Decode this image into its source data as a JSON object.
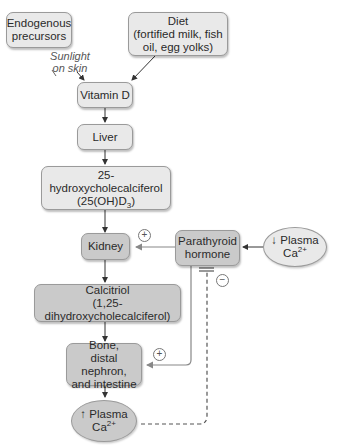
{
  "diagram": {
    "nodes": {
      "endogenous": {
        "line1": "Endogenous",
        "line2": "precursors"
      },
      "diet": {
        "line1": "Diet",
        "line2": "(fortified milk, fish",
        "line3": "oil, egg yolks)"
      },
      "vitamin_d": {
        "label": "Vitamin D"
      },
      "liver": {
        "label": "Liver"
      },
      "hydroxy": {
        "line1": "25-hydroxycholecalciferol",
        "line2_pre": "(25(OH)D",
        "line2_sub": "3",
        "line2_post": ")"
      },
      "kidney": {
        "label": "Kidney"
      },
      "pth": {
        "line1": "Parathyroid",
        "line2": "hormone"
      },
      "low_ca": {
        "arrow": "↓",
        "line1": "Plasma",
        "line2": "Ca",
        "sup": "2+"
      },
      "calcitriol": {
        "line1": "Calcitriol",
        "line2": "(1,25-dihydroxycholecalciferol)"
      },
      "bone": {
        "line1": "Bone,",
        "line2": "distal nephron,",
        "line3": "and intestine"
      },
      "high_ca": {
        "arrow": "↑",
        "line1": "Plasma",
        "line2": "Ca",
        "sup": "2+"
      }
    },
    "edge_labels": {
      "sunlight": {
        "line1": "Sunlight",
        "line2": "on skin"
      },
      "plus_kidney": "+",
      "plus_bone": "+",
      "minus_feedback": "−"
    },
    "colors": {
      "light_fill": "#e9e9e9",
      "dark_fill": "#cacaca",
      "border": "#9a9a9a",
      "arrow": "#444444",
      "pth_link": "#8a8a8a"
    }
  }
}
